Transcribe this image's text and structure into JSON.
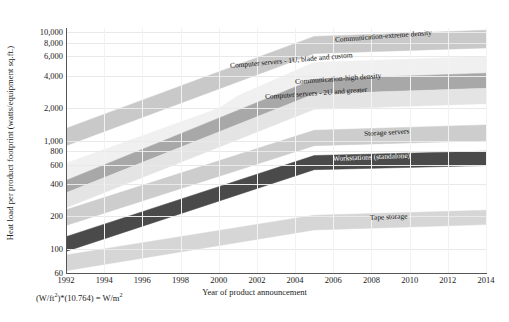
{
  "chart_data": {
    "type": "area",
    "title": "",
    "xlabel": "Year of product announcement",
    "ylabel": "Heat load per product footprint (watts/equipment sq.ft.)",
    "footnote": "(W/ft²)*(10.764) = W/m²",
    "yscale": "log",
    "ylim": [
      60,
      11000
    ],
    "ytick_labels": [
      "10,000",
      "8,000",
      "6,000",
      "4,000",
      "2,000",
      "1,000",
      "800",
      "600",
      "400",
      "200",
      "100",
      "60"
    ],
    "ytick_values": [
      10000,
      8000,
      6000,
      4000,
      2000,
      1000,
      800,
      600,
      400,
      200,
      100,
      60
    ],
    "xlim": [
      1992,
      2014
    ],
    "xtick_labels": [
      "1992",
      "1994",
      "1996",
      "1998",
      "2000",
      "2002",
      "2004",
      "2006",
      "2008",
      "2010",
      "2012",
      "2014"
    ],
    "xtick_values": [
      1992,
      1994,
      1996,
      1998,
      2000,
      2002,
      2004,
      2006,
      2008,
      2010,
      2012,
      2014
    ],
    "grid": true,
    "legend_position": "inline-band-labels",
    "series": [
      {
        "name": "Communication-extreme density",
        "color": "#c9c9c9",
        "label_color": "dark-text",
        "x": [
          1992,
          2005,
          2014
        ],
        "upper": [
          1300,
          9200,
          10500
        ],
        "lower": [
          900,
          6400,
          7200
        ]
      },
      {
        "name": "Computer servers - 1U, blade and custom",
        "color": "#f0f0f0",
        "label_color": "dark-text",
        "x": [
          1992,
          2000,
          2001,
          2005,
          2014
        ],
        "upper": [
          620,
          2000,
          2600,
          5300,
          6000
        ],
        "lower": [
          430,
          1450,
          1500,
          3700,
          4200
        ]
      },
      {
        "name": "Communication-high density",
        "color": "#a8a8a8",
        "label_color": "dark-text",
        "x": [
          1992,
          2005,
          2014
        ],
        "upper": [
          430,
          3700,
          4200
        ],
        "lower": [
          330,
          2700,
          3050
        ]
      },
      {
        "name": "Computer servers - 2U and greater",
        "color": "#e4e4e4",
        "label_color": "dark-text",
        "x": [
          1992,
          2005,
          2014
        ],
        "upper": [
          330,
          2700,
          3050
        ],
        "lower": [
          240,
          1950,
          2200
        ]
      },
      {
        "name": "Storage servers",
        "color": "#cdcdcd",
        "label_color": "dark-text",
        "x": [
          1992,
          2005,
          2014
        ],
        "upper": [
          230,
          1250,
          1400
        ],
        "lower": [
          165,
          900,
          1000
        ]
      },
      {
        "name": "Workstations (standalone)",
        "color": "#4a4a4a",
        "label_color": "light-text",
        "x": [
          1992,
          2005,
          2014
        ],
        "upper": [
          130,
          730,
          800
        ],
        "lower": [
          95,
          540,
          590
        ]
      },
      {
        "name": "Tape storage",
        "color": "#d6d6d6",
        "label_color": "dark-text",
        "x": [
          1992,
          2005,
          2014
        ],
        "upper": [
          88,
          205,
          228
        ],
        "lower": [
          63,
          150,
          168
        ]
      }
    ]
  }
}
